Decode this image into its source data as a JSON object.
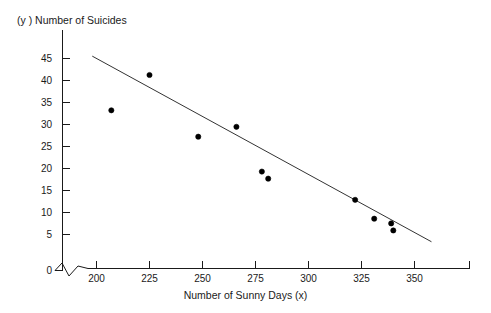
{
  "chart_data": {
    "type": "scatter",
    "title": "",
    "xlabel": "Number of Sunny Days (x)",
    "ylabel": "(y ) Number of Suicides",
    "xlim": [
      185,
      360
    ],
    "ylim": [
      0,
      47
    ],
    "grid": false,
    "legend": "none",
    "axis_break_x": true,
    "xticks": [
      200,
      225,
      250,
      275,
      300,
      325,
      350
    ],
    "yticks": [
      0,
      5,
      10,
      15,
      20,
      25,
      30,
      35,
      40,
      45
    ],
    "x": [
      207,
      225,
      248,
      266,
      278,
      281,
      322,
      331,
      339,
      340
    ],
    "y": [
      34,
      41.5,
      28.4,
      30.5,
      21,
      19.5,
      15,
      11,
      10,
      8.5
    ],
    "points": [
      {
        "x": 207,
        "y": 34
      },
      {
        "x": 225,
        "y": 41.5
      },
      {
        "x": 248,
        "y": 28.4
      },
      {
        "x": 266,
        "y": 30.5
      },
      {
        "x": 278,
        "y": 21
      },
      {
        "x": 281,
        "y": 19.5
      },
      {
        "x": 322,
        "y": 15
      },
      {
        "x": 331,
        "y": 11
      },
      {
        "x": 339,
        "y": 10
      },
      {
        "x": 340,
        "y": 8.5
      }
    ],
    "series": [
      {
        "name": "Suicides vs Sunny Days",
        "values": [
          34,
          41.5,
          28.4,
          30.5,
          21,
          19.5,
          15,
          11,
          10,
          8.5
        ]
      }
    ],
    "trendline": {
      "type": "linear",
      "x_start": 198,
      "y_start": 45.5,
      "x_end": 358,
      "y_end": 6.1
    }
  },
  "labels": {
    "y_axis_title": "(y ) Number of Suicides",
    "x_axis_title": "Number of Sunny Days (x)",
    "y_ticks": [
      "45",
      "40",
      "35",
      "30",
      "25",
      "20",
      "15",
      "10",
      "5",
      "0"
    ],
    "x_ticks": [
      "200",
      "225",
      "250",
      "275",
      "300",
      "325",
      "350"
    ]
  },
  "colors": {
    "axis": "#1a1a1a",
    "point": "#000000",
    "trendline": "#333333",
    "background": "#ffffff"
  }
}
